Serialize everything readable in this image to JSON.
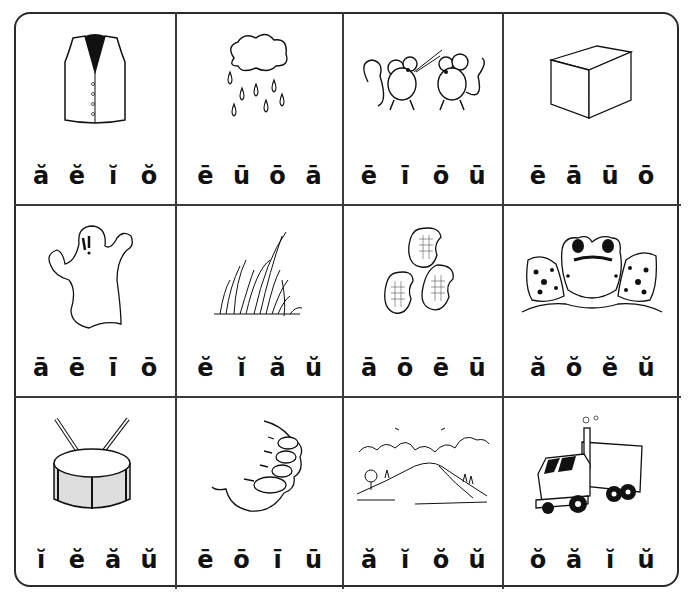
{
  "worksheet": {
    "title": "Vowel sound picture worksheet",
    "cells": [
      {
        "picture": "vest",
        "choices": [
          "ă",
          "ĕ",
          "ĭ",
          "ŏ"
        ]
      },
      {
        "picture": "rain",
        "choices": [
          "ē",
          "ū",
          "ō",
          "ā"
        ]
      },
      {
        "picture": "mice",
        "choices": [
          "ē",
          "ī",
          "ō",
          "ū"
        ]
      },
      {
        "picture": "cube",
        "choices": [
          "ē",
          "ā",
          "ū",
          "ō"
        ]
      },
      {
        "picture": "ghost",
        "choices": [
          "ā",
          "ē",
          "ī",
          "ō"
        ]
      },
      {
        "picture": "grass",
        "choices": [
          "ĕ",
          "ĭ",
          "ă",
          "ŭ"
        ]
      },
      {
        "picture": "beans",
        "choices": [
          "ā",
          "ō",
          "ē",
          "ū"
        ]
      },
      {
        "picture": "frog",
        "choices": [
          "ă",
          "ŏ",
          "ĕ",
          "ŭ"
        ]
      },
      {
        "picture": "drum",
        "choices": [
          "ĭ",
          "ĕ",
          "ă",
          "ŭ"
        ]
      },
      {
        "picture": "toe",
        "choices": [
          "ē",
          "ō",
          "ī",
          "ū"
        ]
      },
      {
        "picture": "hill",
        "choices": [
          "ă",
          "ĭ",
          "ŏ",
          "ŭ"
        ]
      },
      {
        "picture": "truck",
        "choices": [
          "ŏ",
          "ă",
          "ĭ",
          "ŭ"
        ]
      }
    ]
  },
  "colors": {
    "ink": "#111111",
    "grid": "#3a3a3a",
    "paper": "#ffffff"
  }
}
